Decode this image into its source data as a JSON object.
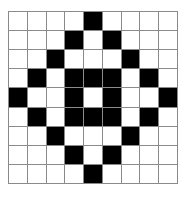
{
  "grid": {
    "rows": 9,
    "cols": 9,
    "filled_color": "#000000",
    "empty_color": "#ffffff",
    "line_color": "#8a8a8a",
    "cells": [
      [
        0,
        0,
        0,
        0,
        1,
        0,
        0,
        0,
        0
      ],
      [
        0,
        0,
        0,
        1,
        0,
        1,
        0,
        0,
        0
      ],
      [
        0,
        0,
        1,
        0,
        0,
        0,
        1,
        0,
        0
      ],
      [
        0,
        1,
        0,
        1,
        1,
        1,
        0,
        1,
        0
      ],
      [
        1,
        0,
        0,
        1,
        0,
        1,
        0,
        0,
        1
      ],
      [
        0,
        1,
        0,
        1,
        1,
        1,
        0,
        1,
        0
      ],
      [
        0,
        0,
        1,
        0,
        0,
        0,
        1,
        0,
        0
      ],
      [
        0,
        0,
        0,
        1,
        0,
        1,
        0,
        0,
        0
      ],
      [
        0,
        0,
        0,
        0,
        1,
        0,
        0,
        0,
        0
      ]
    ]
  }
}
